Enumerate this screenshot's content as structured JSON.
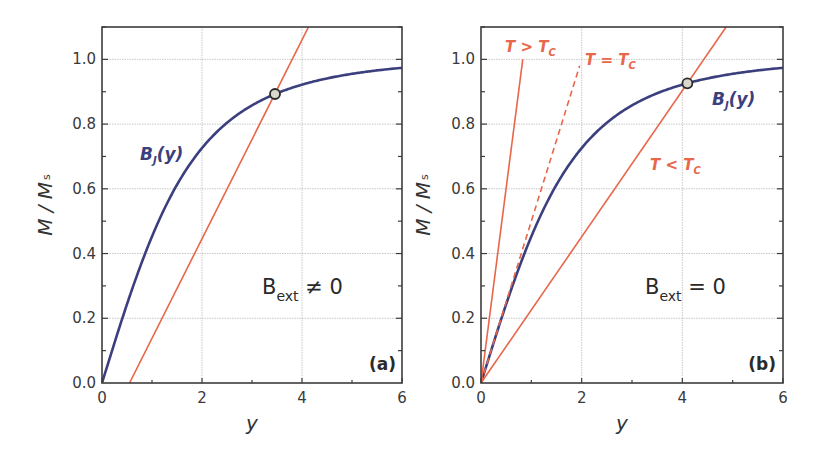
{
  "colors": {
    "curve": "#3b3f7e",
    "line": "#e8664a",
    "frame": "#3c3c3c",
    "grid": "#c8c8c8",
    "marker_fill": "#d8d8cc",
    "marker_edge": "#2a2a2a"
  },
  "chart_data": [
    {
      "type": "line",
      "panel_tag": "(a)",
      "xlabel": "y",
      "ylabel": "M / M_s",
      "ylabel_main": "M / M",
      "ylabel_sub": "s",
      "xlim": [
        0,
        6
      ],
      "ylim": [
        0,
        1.1
      ],
      "xticks": [
        "0",
        "2",
        "4",
        "6"
      ],
      "yticks": [
        "0.0",
        "0.2",
        "0.4",
        "0.6",
        "0.8",
        "1.0"
      ],
      "grid": true,
      "annotation": {
        "main": "B",
        "sub": "ext",
        "rest": " ≠ 0"
      },
      "series": [
        {
          "name": "B_J(y)",
          "label_main": "B",
          "label_sub": "J",
          "label_rest": "(y)",
          "style": "solid",
          "x": [
            0,
            0.5,
            1,
            1.5,
            2,
            2.5,
            3,
            3.5,
            4,
            5,
            6
          ],
          "values": [
            0,
            0.25,
            0.453,
            0.613,
            0.726,
            0.803,
            0.858,
            0.895,
            0.922,
            0.955,
            0.974
          ]
        },
        {
          "name": "linear (B_ext ≠ 0)",
          "style": "solid",
          "x": [
            0.55,
            4.13
          ],
          "values": [
            0,
            1.1
          ]
        }
      ],
      "intersection": {
        "x": 3.46,
        "y": 0.893
      }
    },
    {
      "type": "line",
      "panel_tag": "(b)",
      "xlabel": "y",
      "ylabel": "M / M_s",
      "ylabel_main": "M / M",
      "ylabel_sub": "s",
      "xlim": [
        0,
        6
      ],
      "ylim": [
        0,
        1.1
      ],
      "xticks": [
        "0",
        "2",
        "4",
        "6"
      ],
      "yticks": [
        "0.0",
        "0.2",
        "0.4",
        "0.6",
        "0.8",
        "1.0"
      ],
      "grid": true,
      "annotation": {
        "main": "B",
        "sub": "ext",
        "rest": " = 0"
      },
      "series": [
        {
          "name": "B_J(y)",
          "label_main": "B",
          "label_sub": "J",
          "label_rest": "(y)",
          "style": "solid",
          "x": [
            0,
            0.5,
            1,
            1.5,
            2,
            2.5,
            3,
            3.5,
            4,
            5,
            6
          ],
          "values": [
            0,
            0.25,
            0.453,
            0.613,
            0.726,
            0.803,
            0.858,
            0.895,
            0.922,
            0.955,
            0.974
          ]
        },
        {
          "name": "T > T_C",
          "label_main": "T > T",
          "label_sub": "C",
          "style": "solid",
          "x": [
            0,
            0.83
          ],
          "values": [
            0,
            1.0
          ]
        },
        {
          "name": "T = T_C",
          "label_main": "T = T",
          "label_sub": "C",
          "style": "dashed",
          "x": [
            0,
            1.96
          ],
          "values": [
            0,
            0.98
          ]
        },
        {
          "name": "T < T_C",
          "label_main": "T < T",
          "label_sub": "C",
          "style": "solid",
          "x": [
            0,
            4.87
          ],
          "values": [
            0,
            1.1
          ]
        }
      ],
      "intersection": {
        "x": 4.1,
        "y": 0.926
      }
    }
  ]
}
